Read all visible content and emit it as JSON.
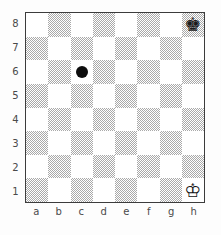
{
  "diagram": {
    "type": "chessboard",
    "orientation": "white-bottom",
    "files": [
      "a",
      "b",
      "c",
      "d",
      "e",
      "f",
      "g",
      "h"
    ],
    "ranks": [
      "8",
      "7",
      "6",
      "5",
      "4",
      "3",
      "2",
      "1"
    ],
    "colors": {
      "light_square": "#ffffff",
      "dark_square": "#a9a9a9",
      "border": "#3c3c3c",
      "background": "#fdfdfd",
      "label": "#4a4a4a",
      "marker": "#0d0d0d"
    },
    "pieces": [
      {
        "square": "h8",
        "glyph": "♚",
        "name": "black-king",
        "color": "black"
      },
      {
        "square": "h1",
        "glyph": "♔",
        "name": "white-king",
        "color": "white"
      }
    ],
    "markers": [
      {
        "square": "c6",
        "shape": "filled-circle",
        "name": "square-marker-dot"
      }
    ],
    "squares": [
      {
        "id": "a8",
        "shade": "light"
      },
      {
        "id": "b8",
        "shade": "dark"
      },
      {
        "id": "c8",
        "shade": "light"
      },
      {
        "id": "d8",
        "shade": "dark"
      },
      {
        "id": "e8",
        "shade": "light"
      },
      {
        "id": "f8",
        "shade": "dark"
      },
      {
        "id": "g8",
        "shade": "light"
      },
      {
        "id": "h8",
        "shade": "dark"
      },
      {
        "id": "a7",
        "shade": "dark"
      },
      {
        "id": "b7",
        "shade": "light"
      },
      {
        "id": "c7",
        "shade": "dark"
      },
      {
        "id": "d7",
        "shade": "light"
      },
      {
        "id": "e7",
        "shade": "dark"
      },
      {
        "id": "f7",
        "shade": "light"
      },
      {
        "id": "g7",
        "shade": "dark"
      },
      {
        "id": "h7",
        "shade": "light"
      },
      {
        "id": "a6",
        "shade": "light"
      },
      {
        "id": "b6",
        "shade": "dark"
      },
      {
        "id": "c6",
        "shade": "light"
      },
      {
        "id": "d6",
        "shade": "dark"
      },
      {
        "id": "e6",
        "shade": "light"
      },
      {
        "id": "f6",
        "shade": "dark"
      },
      {
        "id": "g6",
        "shade": "light"
      },
      {
        "id": "h6",
        "shade": "dark"
      },
      {
        "id": "a5",
        "shade": "dark"
      },
      {
        "id": "b5",
        "shade": "light"
      },
      {
        "id": "c5",
        "shade": "dark"
      },
      {
        "id": "d5",
        "shade": "light"
      },
      {
        "id": "e5",
        "shade": "dark"
      },
      {
        "id": "f5",
        "shade": "light"
      },
      {
        "id": "g5",
        "shade": "dark"
      },
      {
        "id": "h5",
        "shade": "light"
      },
      {
        "id": "a4",
        "shade": "light"
      },
      {
        "id": "b4",
        "shade": "dark"
      },
      {
        "id": "c4",
        "shade": "light"
      },
      {
        "id": "d4",
        "shade": "dark"
      },
      {
        "id": "e4",
        "shade": "light"
      },
      {
        "id": "f4",
        "shade": "dark"
      },
      {
        "id": "g4",
        "shade": "light"
      },
      {
        "id": "h4",
        "shade": "dark"
      },
      {
        "id": "a3",
        "shade": "dark"
      },
      {
        "id": "b3",
        "shade": "light"
      },
      {
        "id": "c3",
        "shade": "dark"
      },
      {
        "id": "d3",
        "shade": "light"
      },
      {
        "id": "e3",
        "shade": "dark"
      },
      {
        "id": "f3",
        "shade": "light"
      },
      {
        "id": "g3",
        "shade": "dark"
      },
      {
        "id": "h3",
        "shade": "light"
      },
      {
        "id": "a2",
        "shade": "light"
      },
      {
        "id": "b2",
        "shade": "dark"
      },
      {
        "id": "c2",
        "shade": "light"
      },
      {
        "id": "d2",
        "shade": "dark"
      },
      {
        "id": "e2",
        "shade": "light"
      },
      {
        "id": "f2",
        "shade": "dark"
      },
      {
        "id": "g2",
        "shade": "light"
      },
      {
        "id": "h2",
        "shade": "dark"
      },
      {
        "id": "a1",
        "shade": "dark"
      },
      {
        "id": "b1",
        "shade": "light"
      },
      {
        "id": "c1",
        "shade": "dark"
      },
      {
        "id": "d1",
        "shade": "light"
      },
      {
        "id": "e1",
        "shade": "dark"
      },
      {
        "id": "f1",
        "shade": "light"
      },
      {
        "id": "g1",
        "shade": "dark"
      },
      {
        "id": "h1",
        "shade": "light"
      }
    ]
  }
}
